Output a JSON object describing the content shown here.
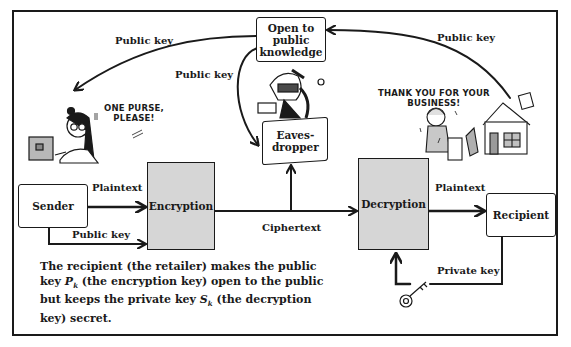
{
  "diagram": {
    "nodes": {
      "sender": "Sender",
      "encryption": "Encryption",
      "decryption": "Decryption",
      "recipient": "Recipient",
      "public_knowledge": "Open to public knowledge",
      "public_knowledge_lines": [
        "Open to",
        "public",
        "knowledge"
      ],
      "eavesdropper_lines": [
        "Eaves-",
        "dropper"
      ]
    },
    "edge_labels": {
      "sender_plaintext": "Plaintext",
      "sender_public_key": "Public key",
      "ciphertext": "Ciphertext",
      "recipient_plaintext": "Plaintext",
      "private_key": "Private key",
      "public_key_to_sender": "Public key",
      "public_key_to_eavesdropper": "Public key",
      "public_key_from_recipient": "Public key"
    },
    "speech": {
      "customer": [
        "ONE PURSE,",
        "PLEASE!"
      ],
      "retailer": [
        "THANK YOU FOR YOUR",
        "BUSINESS!"
      ]
    },
    "illustrations": [
      "customer-with-laptop",
      "eavesdropper-spy",
      "retailer-shopkeeper",
      "shop-building",
      "key-icon"
    ],
    "caption": {
      "part1": "The recipient (the retailer) makes the public key ",
      "pk_symbol": "P",
      "pk_sub": "k",
      "part2": " (the encryption key) open to the public but keeps the private key ",
      "sk_symbol": "S",
      "sk_sub": "k",
      "part3": " (the decryption key) secret."
    },
    "colors": {
      "ink": "#1a1a1a",
      "process_fill": "#d6d6d6",
      "background": "#ffffff"
    }
  }
}
